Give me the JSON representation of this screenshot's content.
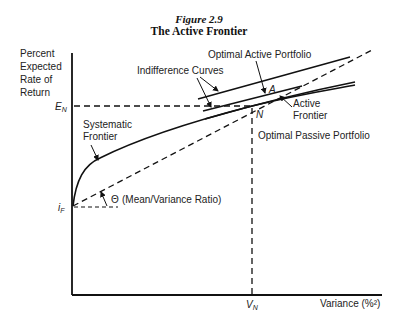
{
  "figure": {
    "number": "Figure 2.9",
    "title": "The Active Frontier"
  },
  "axes": {
    "y_label_lines": [
      "Percent",
      "Expected",
      "Rate of",
      "Return"
    ],
    "x_label": "Variance (%²)",
    "y_ticks": {
      "E_N": "E",
      "E_N_sub": "N",
      "i_F": "i",
      "i_F_sub": "F"
    },
    "x_ticks": {
      "V_N": "V",
      "V_N_sub": "N"
    }
  },
  "annotations": {
    "optimal_active_portfolio": "Optimal Active Portfolio",
    "indifference_curves": "Indifference Curves",
    "active_frontier_line1": "Active",
    "active_frontier_line2": "Frontier",
    "point_A": "A",
    "point_N": "N",
    "optimal_passive_portfolio": "Optimal Passive Portfolio",
    "systematic_frontier_line1": "Systematic",
    "systematic_frontier_line2": "Frontier",
    "theta": "Θ",
    "theta_desc": "(Mean/Variance Ratio)"
  }
}
